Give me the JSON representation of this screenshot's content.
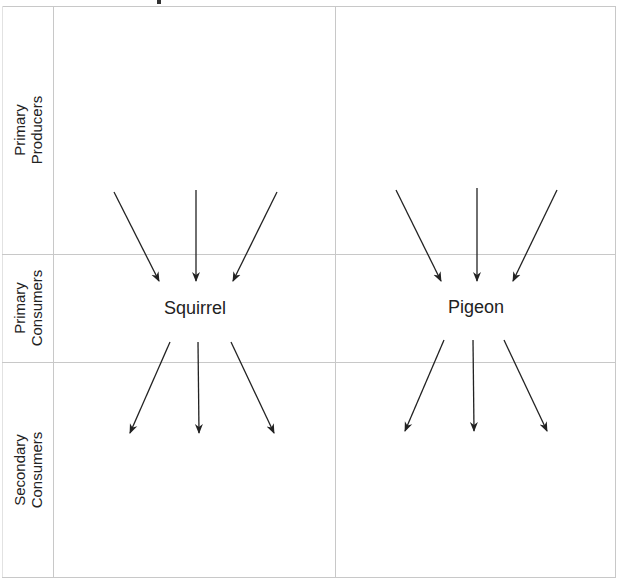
{
  "diagram": {
    "type": "food-web-worksheet",
    "rows": [
      {
        "label_line1": "Primary",
        "label_line2": "Producers"
      },
      {
        "label_line1": "Primary",
        "label_line2": "Consumers"
      },
      {
        "label_line1": "Secondary",
        "label_line2": "Consumers"
      }
    ],
    "organisms": [
      {
        "name": "Squirrel",
        "column": 1,
        "row": "Primary Consumers"
      },
      {
        "name": "Pigeon",
        "column": 2,
        "row": "Primary Consumers"
      }
    ],
    "arrows": {
      "squirrel_incoming": 3,
      "squirrel_outgoing": 3,
      "pigeon_incoming": 3,
      "pigeon_outgoing": 3
    },
    "colors": {
      "grid": "#c8c8c8",
      "arrow": "#222222",
      "text": "#222222"
    }
  }
}
